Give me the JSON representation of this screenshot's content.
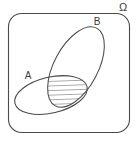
{
  "figure": {
    "type": "venn-diagram",
    "background_color": "#ffffff",
    "stroke_color": "#4a4a4a",
    "label_color": "#3a3a3a",
    "hatch_color": "#4a4a4a"
  },
  "universe": {
    "label": "Ω",
    "label_name": "omega",
    "shape": "rounded-rectangle",
    "x": 8,
    "y": 13,
    "width": 122,
    "height": 120,
    "corner_radius": 13,
    "label_x": 123,
    "label_y": 10
  },
  "sets": [
    {
      "id": "A",
      "label": "A",
      "shape": "ellipse",
      "cx": 51,
      "cy": 95,
      "rx": 37,
      "ry": 18,
      "rotation_deg": -13,
      "label_x": 28,
      "label_y": 79
    },
    {
      "id": "B",
      "label": "B",
      "shape": "ellipse",
      "cx": 76,
      "cy": 67,
      "rx": 44,
      "ry": 22,
      "rotation_deg": -62,
      "label_x": 97,
      "label_y": 25
    }
  ],
  "intersection": {
    "name": "A-intersect-B",
    "fill": "diagonal-hatch",
    "hatch_angle_deg": 30,
    "hatch_spacing_px": 4,
    "hatch_line_count": 5,
    "center_x": 60,
    "center_y": 90
  }
}
